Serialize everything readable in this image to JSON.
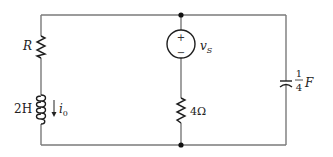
{
  "diagram": {
    "type": "circuit",
    "components": {
      "resistor_r": {
        "label": "R"
      },
      "inductor": {
        "label_value": "2H",
        "current_label": "i",
        "current_subscript": "0"
      },
      "voltage_source": {
        "label": "v",
        "subscript": "S",
        "plus": "+",
        "minus": "−"
      },
      "resistor_4": {
        "label": "4Ω"
      },
      "capacitor": {
        "frac_num": "1",
        "frac_den": "4",
        "unit": "F"
      }
    },
    "colors": {
      "wire": "#7a7a7a",
      "component": "#1e1e1e",
      "text": "#222222"
    }
  }
}
